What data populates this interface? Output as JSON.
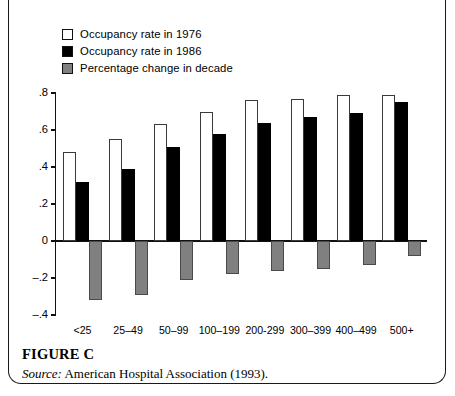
{
  "figure": {
    "title": "FIGURE C",
    "source_keyword": "Source:",
    "source_text": " American Hospital Association (1993)."
  },
  "legend": {
    "items": [
      {
        "label": "Occupancy rate in 1976",
        "swatch": "white-square-icon",
        "color": "#ffffff"
      },
      {
        "label": "Occupancy rate in 1986",
        "swatch": "black-square-icon",
        "color": "#000000"
      },
      {
        "label": "Percentage change in decade",
        "swatch": "gray-square-icon",
        "color": "#808080"
      }
    ]
  },
  "chart_data": {
    "type": "bar",
    "title": "",
    "subtitle": "",
    "xlabel": "",
    "ylabel": "",
    "categories": [
      "<25",
      "25–49",
      "50–99",
      "100–199",
      "200-299",
      "300–399",
      "400–499",
      "500+"
    ],
    "series": [
      {
        "name": "Occupancy rate in 1976",
        "color": "#ffffff",
        "values": [
          0.48,
          0.55,
          0.63,
          0.7,
          0.76,
          0.77,
          0.79,
          0.79
        ]
      },
      {
        "name": "Occupancy rate in 1986",
        "color": "#000000",
        "values": [
          0.32,
          0.39,
          0.51,
          0.58,
          0.64,
          0.67,
          0.69,
          0.75
        ]
      },
      {
        "name": "Percentage change in decade",
        "color": "#808080",
        "values": [
          -0.32,
          -0.29,
          -0.21,
          -0.18,
          -0.16,
          -0.15,
          -0.13,
          -0.08
        ]
      }
    ],
    "ylim": [
      -0.4,
      0.8
    ],
    "yticks": [
      0.8,
      0.6,
      0.4,
      0.2,
      0,
      -0.2,
      -0.4
    ],
    "ytick_labels": [
      ".8",
      ".6",
      ".4",
      ".2",
      "0",
      "–.2",
      "–.4"
    ],
    "grid": false,
    "legend_position": "top-left"
  }
}
